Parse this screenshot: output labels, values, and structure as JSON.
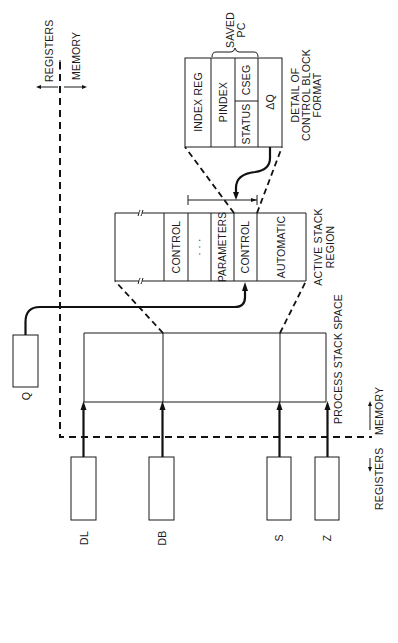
{
  "diagram": {
    "colors": {
      "ink": "#1a1a1a",
      "background": "#ffffff"
    },
    "boundary": {
      "top_labels": {
        "left": "REGISTERS",
        "right": "MEMORY"
      },
      "bottom_labels": {
        "left": "REGISTERS",
        "right": "MEMORY"
      }
    },
    "registers": [
      {
        "id": "DL",
        "label": "DL"
      },
      {
        "id": "DB",
        "label": "DB"
      },
      {
        "id": "S",
        "label": "S"
      },
      {
        "id": "Z",
        "label": "Z"
      },
      {
        "id": "Q",
        "label": "Q"
      }
    ],
    "process_stack": {
      "label": "PROCESS STACK SPACE"
    },
    "active_stack": {
      "label_line1": "ACTIVE STACK",
      "label_line2": "REGION",
      "cells": [
        {
          "label": ""
        },
        {
          "label": "CONTROL"
        },
        {
          "label": "· · ·"
        },
        {
          "label": "PARAMETERS"
        },
        {
          "label": "CONTROL"
        },
        {
          "label": "AUTOMATIC"
        }
      ]
    },
    "control_block": {
      "label_line1": "DETAIL OF",
      "label_line2": "CONTROL BLOCK",
      "label_line3": "FORMAT",
      "saved_pc_line1": "SAVED",
      "saved_pc_line2": "PC",
      "fields": {
        "index_reg": "INDEX REG",
        "pindex": "PINDEX",
        "status": "STATUS",
        "cseg": "CSEG",
        "delta_q": "ΔQ"
      }
    }
  }
}
